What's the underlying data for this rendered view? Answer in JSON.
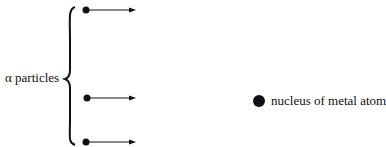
{
  "diagram": {
    "alpha_label": "α particles",
    "nucleus_label": "nucleus of metal atom",
    "particles": [
      {
        "y": 10
      },
      {
        "y": 98
      },
      {
        "y": 142
      }
    ],
    "nucleus": {
      "x": 259,
      "y": 101,
      "r": 6
    },
    "colors": {
      "ink": "#111111",
      "background": "#ffffff"
    }
  }
}
